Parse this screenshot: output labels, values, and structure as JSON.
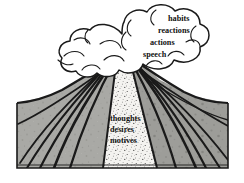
{
  "figure": {
    "background_color": "#ffffff"
  },
  "colors": {
    "outline": "#1a1a1a",
    "cone_fill": "#a8a8a4",
    "cone_fill_dark": "#8f8f8b",
    "conduit_fill": "#f2f1ee",
    "stipple": "#2b2b2b",
    "cloud_fill": "#ffffff",
    "text": "#111111",
    "ground_line": "#1a1a1a"
  },
  "cloud": {
    "name": "eruption-cloud",
    "labels": [
      {
        "text": "habits",
        "x": 168,
        "y": 21
      },
      {
        "text": "reactions",
        "x": 158,
        "y": 33
      },
      {
        "text": "actions",
        "x": 150,
        "y": 45
      },
      {
        "text": "speech",
        "x": 143,
        "y": 57
      }
    ]
  },
  "conduit": {
    "name": "magma-conduit",
    "labels": [
      {
        "text": "thoughts",
        "x": 110,
        "y": 121
      },
      {
        "text": "desires",
        "x": 110,
        "y": 132
      },
      {
        "text": "motives",
        "x": 110,
        "y": 143
      }
    ]
  },
  "ground": {
    "name": "ground-baseline",
    "left": 17,
    "right": 228,
    "top": 103,
    "bottom": 168
  }
}
